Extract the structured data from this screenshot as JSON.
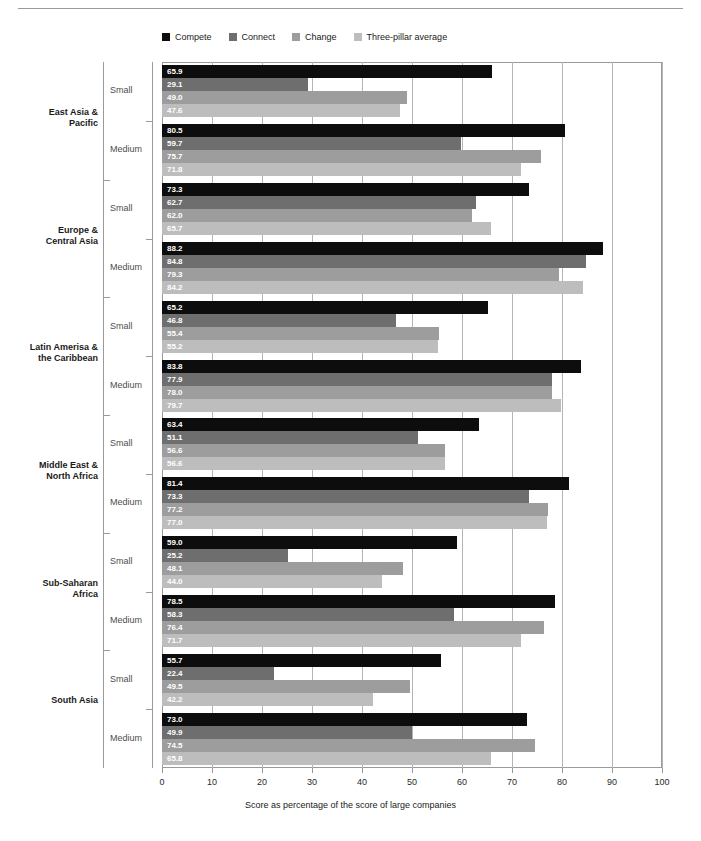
{
  "header": {
    "faint_running_text": "",
    "rule_color": "#9a9a9a"
  },
  "legend": {
    "position": "top",
    "items": [
      {
        "label": "Compete",
        "color": "#0d0d0d"
      },
      {
        "label": "Connect",
        "color": "#6e6e6e"
      },
      {
        "label": "Change",
        "color": "#9d9d9d"
      },
      {
        "label": "Three-pillar average",
        "color": "#bdbdbd"
      }
    ]
  },
  "axis": {
    "x_title": "Score as percentage of the score of large companies",
    "x_ticks": [
      "0",
      "10",
      "20",
      "30",
      "40",
      "50",
      "60",
      "70",
      "80",
      "90",
      "100"
    ]
  },
  "size_labels": {
    "small": "Small",
    "medium": "Medium"
  },
  "chart_data": {
    "type": "bar",
    "orientation": "horizontal",
    "title": "",
    "xlabel": "Score as percentage of the score of large companies",
    "ylabel": "",
    "xlim": [
      0,
      100
    ],
    "xticks": [
      0,
      10,
      20,
      30,
      40,
      50,
      60,
      70,
      80,
      90,
      100
    ],
    "grid": "vertical",
    "legend_position": "top",
    "series_names": [
      "Compete",
      "Connect",
      "Change",
      "Three-pillar average"
    ],
    "series_colors": [
      "#0d0d0d",
      "#6e6e6e",
      "#9d9d9d",
      "#bdbdbd"
    ],
    "groups": [
      {
        "region": "East Asia &\nPacific",
        "region_line1": "East Asia &",
        "region_line2": "Pacific",
        "subgroups": [
          {
            "size": "Small",
            "values": [
              65.9,
              29.1,
              49.0,
              47.6
            ],
            "labels": [
              "65.9",
              "29.1",
              "49.0",
              "47.6"
            ]
          },
          {
            "size": "Medium",
            "values": [
              80.5,
              59.7,
              75.7,
              71.8
            ],
            "labels": [
              "80.5",
              "59.7",
              "75.7",
              "71.8"
            ]
          }
        ]
      },
      {
        "region": "Europe &\nCentral Asia",
        "region_line1": "Europe &",
        "region_line2": "Central Asia",
        "subgroups": [
          {
            "size": "Small",
            "values": [
              73.3,
              62.7,
              62.0,
              65.7
            ],
            "labels": [
              "73.3",
              "62.7",
              "62.0",
              "65.7"
            ]
          },
          {
            "size": "Medium",
            "values": [
              88.2,
              84.8,
              79.3,
              84.2
            ],
            "labels": [
              "88.2",
              "84.8",
              "79.3",
              "84.2"
            ]
          }
        ]
      },
      {
        "region": "Latin Amerisa &\nthe Caribbean",
        "region_line1": "Latin Amerisa &",
        "region_line2": "the Caribbean",
        "subgroups": [
          {
            "size": "Small",
            "values": [
              65.2,
              46.8,
              55.4,
              55.2
            ],
            "labels": [
              "65.2",
              "46.8",
              "55.4",
              "55.2"
            ]
          },
          {
            "size": "Medium",
            "values": [
              83.8,
              77.9,
              78.0,
              79.7
            ],
            "labels": [
              "83.8",
              "77.9",
              "78.0",
              "79.7"
            ]
          }
        ]
      },
      {
        "region": "Middle East &\nNorth Africa",
        "region_line1": "Middle East &",
        "region_line2": "North Africa",
        "subgroups": [
          {
            "size": "Small",
            "values": [
              63.4,
              51.1,
              56.6,
              56.6
            ],
            "labels": [
              "63.4",
              "51.1",
              "56.6",
              "56.6"
            ]
          },
          {
            "size": "Medium",
            "values": [
              81.4,
              73.3,
              77.2,
              77.0
            ],
            "labels": [
              "81.4",
              "73.3",
              "77.2",
              "77.0"
            ]
          }
        ]
      },
      {
        "region": "Sub-Saharan\nAfrica",
        "region_line1": "Sub-Saharan",
        "region_line2": "Africa",
        "subgroups": [
          {
            "size": "Small",
            "values": [
              59.0,
              25.2,
              48.1,
              44.0
            ],
            "labels": [
              "59.0",
              "25.2",
              "48.1",
              "44.0"
            ]
          },
          {
            "size": "Medium",
            "values": [
              78.5,
              58.3,
              76.4,
              71.7
            ],
            "labels": [
              "78.5",
              "58.3",
              "76.4",
              "71.7"
            ]
          }
        ]
      },
      {
        "region": "South Asia",
        "region_line1": "South Asia",
        "region_line2": "",
        "subgroups": [
          {
            "size": "Small",
            "values": [
              55.7,
              22.4,
              49.5,
              42.2
            ],
            "labels": [
              "55.7",
              "22.4",
              "49.5",
              "42.2"
            ]
          },
          {
            "size": "Medium",
            "values": [
              73.0,
              49.9,
              74.5,
              65.8
            ],
            "labels": [
              "73.0",
              "49.9",
              "74.5",
              "65.8"
            ]
          }
        ]
      }
    ]
  }
}
